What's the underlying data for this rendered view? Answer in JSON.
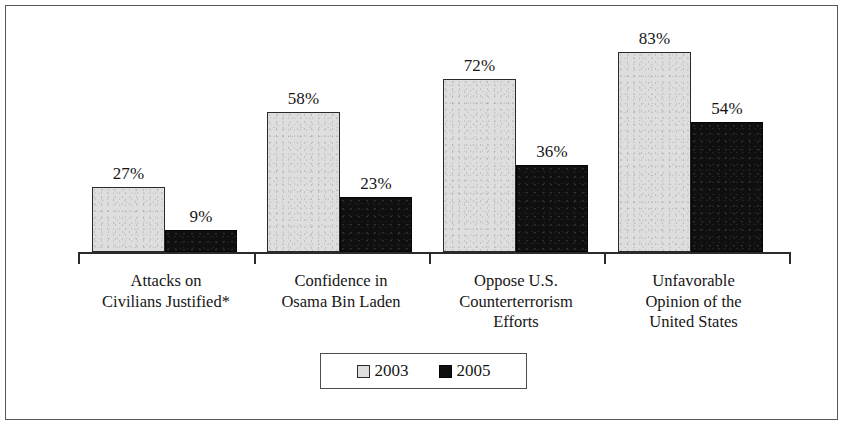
{
  "chart_data": {
    "type": "bar",
    "title": "",
    "subtitle": "",
    "xlabel": "",
    "ylabel": "",
    "ylim": [
      0,
      100
    ],
    "grid": false,
    "legend_position": "bottom-center",
    "categories": [
      "Attacks on Civilians Justified*",
      "Confidence in Osama Bin Laden",
      "Oppose U.S. Counterterrorism Efforts",
      "Unfavorable Opinion of the United States"
    ],
    "category_lines": [
      [
        "Attacks on",
        "Civilians Justified*"
      ],
      [
        "Confidence in",
        "Osama Bin Laden"
      ],
      [
        "Oppose U.S.",
        "Counterterrorism",
        "Efforts"
      ],
      [
        "Unfavorable",
        "Opinion of the",
        "United States"
      ]
    ],
    "series": [
      {
        "name": "2003",
        "color": "#dedede",
        "values": [
          27,
          58,
          72,
          83
        ],
        "value_labels": [
          "27%",
          "58%",
          "72%",
          "83%"
        ]
      },
      {
        "name": "2005",
        "color": "#100f0f",
        "values": [
          9,
          23,
          36,
          54
        ],
        "value_labels": [
          "9%",
          "23%",
          "36%",
          "54%"
        ]
      }
    ],
    "legend": [
      {
        "label": "2003",
        "swatch": "light-gray-square"
      },
      {
        "label": "2005",
        "swatch": "black-square"
      }
    ],
    "annotations": []
  },
  "figure": {
    "frame_color": "#575757",
    "axis_color": "#2b2b2b",
    "background": "#ffffff"
  }
}
